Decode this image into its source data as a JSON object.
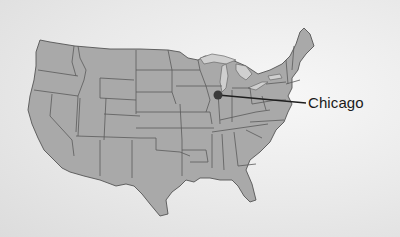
{
  "map": {
    "subject": "Contiguous United States",
    "style": "grayscale relief with state borders",
    "colors": {
      "background": "#ececec",
      "land": "#a9a9a9",
      "borders": "#555555",
      "lakes": "#cfcfcf",
      "marker": "#3a3a3a",
      "text": "#1a1a1a"
    },
    "markers": [
      {
        "name": "Chicago",
        "label": "Chicago",
        "x": 218,
        "y": 95,
        "label_x": 308,
        "label_y": 100
      }
    ]
  }
}
